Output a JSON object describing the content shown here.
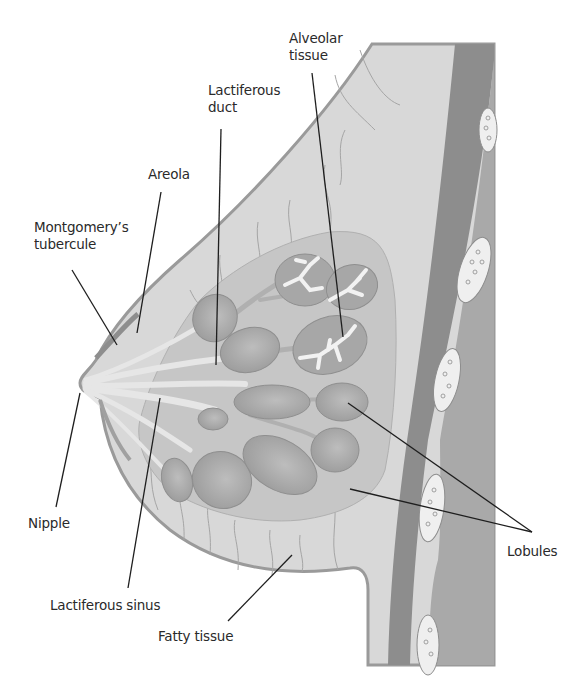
{
  "figure": {
    "colors": {
      "background": "#ffffff",
      "body_tissue": "#d9d9d9",
      "outline": "#9a9a9a",
      "fatty_tissue": "#d6d6d6",
      "lobe_region": "#c2c2c2",
      "lobule": "#a8a8a8",
      "duct": "#e4e4e4",
      "chest_muscle": "#8c8c8c",
      "rib_band": "#a9a9a9",
      "rib_oval": "#eeeeee",
      "leader_line": "#1e1e1e",
      "label_text": "#2a2a2a"
    }
  },
  "labels": {
    "alveolar_tissue": "Alveolar\ntissue",
    "lactiferous_duct": "Lactiferous\nduct",
    "areola": "Areola",
    "montgomerys_tubercule": "Montgomery’s\ntubercule",
    "nipple": "Nipple",
    "lactiferous_sinus": "Lactiferous sinus",
    "fatty_tissue": "Fatty tissue",
    "lobules": "Lobules"
  }
}
